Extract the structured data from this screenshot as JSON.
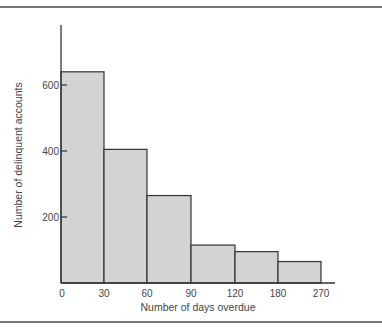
{
  "chart_data": {
    "type": "bar",
    "title": "",
    "xlabel": "Number of days overdue",
    "ylabel": "Number of delinquent accounts",
    "x_edges": [
      0,
      30,
      60,
      90,
      120,
      180,
      270
    ],
    "x_tick_labels": [
      "0",
      "30",
      "60",
      "90",
      "120",
      "180",
      "270"
    ],
    "categories": [
      "0-30",
      "30-60",
      "60-90",
      "90-120",
      "120-180",
      "180-270"
    ],
    "values": [
      640,
      405,
      265,
      115,
      95,
      65
    ],
    "yticks": [
      200,
      400,
      600
    ],
    "ylim": [
      0,
      780
    ],
    "grid": false,
    "bar_color": "#d3d3d3",
    "edge_color": "#333333"
  }
}
